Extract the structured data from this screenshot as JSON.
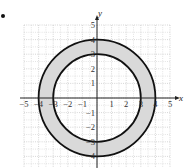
{
  "problem": {
    "bullet": "•"
  },
  "chart_data": {
    "type": "region",
    "title": "",
    "xlabel": "x",
    "ylabel": "y",
    "xlim": [
      -5,
      5
    ],
    "ylim": [
      -5,
      5
    ],
    "grid": true,
    "x_ticks": [
      -5,
      -4,
      -3,
      -2,
      -1,
      1,
      2,
      3,
      4,
      5
    ],
    "y_ticks": [
      -5,
      -4,
      -3,
      -2,
      -1,
      1,
      2,
      3,
      4,
      5
    ],
    "x_tick_labels": [
      "−5",
      "−4",
      "−3",
      "−2",
      "−1",
      "1",
      "2",
      "3",
      "4",
      "5"
    ],
    "y_tick_labels": [
      "−5",
      "−4",
      "−3",
      "−2",
      "−1",
      "1",
      "2",
      "3",
      "4",
      "5"
    ],
    "series": [
      {
        "name": "outer circle",
        "center": [
          0,
          0
        ],
        "radius": 4
      },
      {
        "name": "inner circle",
        "center": [
          0,
          0
        ],
        "radius": 3
      }
    ],
    "shaded_region": "3 ≤ x² + y² ≤ 16 (between r=3 and r=4)",
    "colors": {
      "fill": "#d9d9d9",
      "stroke": "#111111",
      "grid": "#bbbbbb",
      "axis": "#222222"
    }
  }
}
